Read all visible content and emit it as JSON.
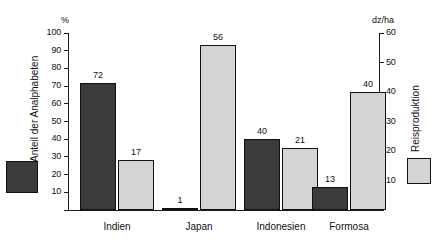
{
  "chart_data": {
    "type": "bar",
    "title": "",
    "categories": [
      "Indien",
      "Japan",
      "Indonesien",
      "Formosa"
    ],
    "series": [
      {
        "name": "Anteil der Analphabeten",
        "unit": "%",
        "axis": "left",
        "color": "#3b3b3b",
        "values": [
          72,
          1,
          40,
          13
        ]
      },
      {
        "name": "Reisproduktion",
        "unit": "dz/ha",
        "axis": "right",
        "color": "#d4d4d4",
        "values": [
          17,
          56,
          21,
          40
        ]
      }
    ],
    "left_axis": {
      "label": "Anteil der Analphabeten",
      "unit": "%",
      "ticks": [
        0,
        10,
        20,
        30,
        40,
        50,
        60,
        70,
        80,
        90,
        100
      ],
      "tick_labels": [
        "",
        "10",
        "20",
        "30",
        "40",
        "50",
        "60",
        "70",
        "80",
        "90",
        "100"
      ],
      "ylim": [
        0,
        100
      ]
    },
    "right_axis": {
      "label": "Reisproduktion",
      "unit": "dz/ha",
      "ticks": [
        0,
        10,
        20,
        30,
        40,
        50,
        60
      ],
      "tick_labels": [
        "",
        "10",
        "20",
        "30",
        "40",
        "50",
        "60"
      ],
      "ylim": [
        0,
        60
      ]
    },
    "legend": {
      "position": "outside-left-and-right",
      "entries": [
        {
          "label": "Anteil der Analphabeten",
          "color": "#3b3b3b"
        },
        {
          "label": "Reisproduktion",
          "color": "#d4d4d4"
        }
      ]
    },
    "grid": false,
    "data_labels": true
  }
}
